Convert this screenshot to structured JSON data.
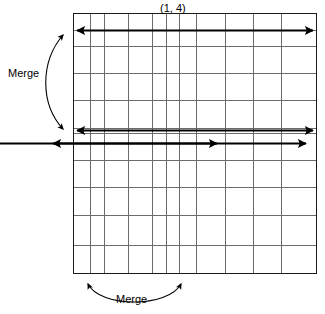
{
  "figure": {
    "title_label": "(1, 4)",
    "merge_left_label": "Merge",
    "merge_bottom_label": "Merge",
    "colors": {
      "background": "#ffffff",
      "grid_line": "#6b6b6b",
      "grid_border": "#1a1a1a",
      "arrow": "#000000",
      "text": "#000000"
    },
    "grid": {
      "left": 73,
      "right": 317,
      "top": 13,
      "bottom": 274,
      "vertical_lines": [
        73,
        90,
        104,
        128,
        152,
        166,
        179,
        196,
        225,
        253,
        281,
        317
      ],
      "horizontal_lines": [
        13,
        30,
        46,
        73,
        100,
        128,
        133,
        160,
        187,
        215,
        245,
        274
      ],
      "columns": 11,
      "rows": 11
    },
    "arrows": {
      "vertical_left": {
        "x": 90,
        "y_top": 15,
        "y_bottom": 272
      },
      "vertical_right": {
        "x": 179,
        "y_top": 15,
        "y_bottom": 272
      },
      "horizontal_top": {
        "y": 31,
        "x_left": 74,
        "x_right": 316
      },
      "horizontal_bottom": {
        "y": 130,
        "x_left": 74,
        "x_right": 316
      },
      "curve_left": {
        "x_start": 55,
        "y_start": 36,
        "x_end": 55,
        "y_end": 128
      },
      "curve_bottom": {
        "x_start": 90,
        "y_start": 283,
        "x_end": 179,
        "y_end": 283
      }
    }
  }
}
